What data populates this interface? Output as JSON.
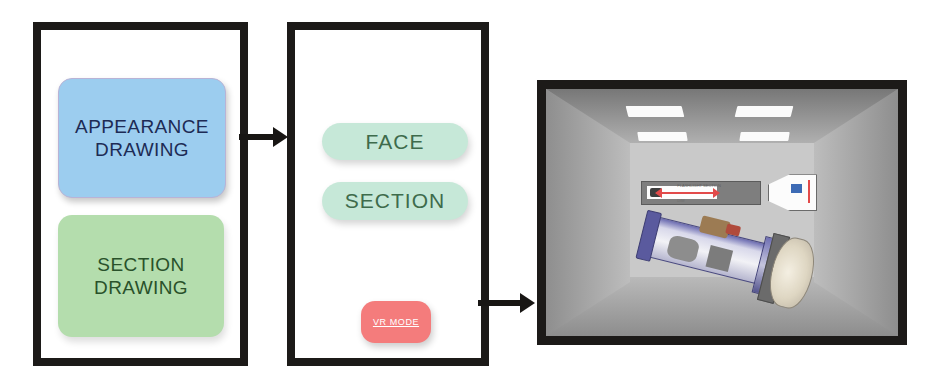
{
  "panels": {
    "drawings": {
      "name": "Drawings panel",
      "cards": [
        {
          "id": "appearance",
          "line1": "APPEARANCE",
          "line2": "DRAWING",
          "bg_color": "#9CCDEF",
          "text_color": "#1D2B55"
        },
        {
          "id": "section",
          "line1": "SECTION",
          "line2": "DRAWING",
          "bg_color": "#B4DDAD",
          "text_color": "#29512A"
        }
      ]
    },
    "modes": {
      "name": "Mode selection panel",
      "pills": [
        {
          "id": "face",
          "label": "FACE",
          "bg_color": "#C6E8D8",
          "text_color": "#3E6B4C"
        },
        {
          "id": "section",
          "label": "SECTION",
          "bg_color": "#C6E8D8",
          "text_color": "#3E6B4C"
        }
      ],
      "vr_button": {
        "id": "vr-mode",
        "label": "VR MODE",
        "bg_color": "#F47C7C",
        "text_color": "#FFFFFF",
        "underlined": true
      }
    },
    "vr": {
      "name": "VR room preview",
      "room": {
        "wall_color": "#C9C9C9",
        "floor_color": "#BDBDBD",
        "ceiling_color": "#9A9A9A",
        "light_color": "#FBFBFB",
        "light_count": 4
      },
      "objects": [
        {
          "id": "section-drawing-plane",
          "type": "2d-section-drawing",
          "description": "Flat flashlight section drawing with red dimension arrows",
          "body_color": "#7E7E7E",
          "accent_color": "#E24A4A",
          "annotation_top": "FLASHLIGHT SECTION",
          "annotation_bottom": "DIM"
        },
        {
          "id": "flashlight-3d-model",
          "type": "3d-cutaway-model",
          "description": "Purple-blue cutaway flashlight model tilted in space",
          "shell_color": "#5A5A9E",
          "reflector_color": "#DED6C2",
          "switch_color": "#9C7B53"
        }
      ]
    }
  },
  "arrows": [
    {
      "id": "arrow-drawings-to-modes",
      "from": "drawings",
      "to": "modes",
      "color": "#181614"
    },
    {
      "id": "arrow-modes-to-vr",
      "from": "modes",
      "to": "vr",
      "color": "#181614"
    }
  ]
}
